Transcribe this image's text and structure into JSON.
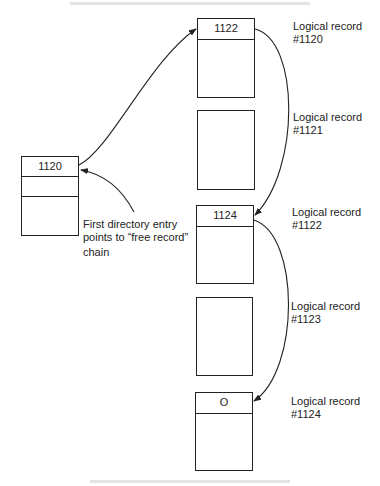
{
  "directory": {
    "entries": [
      "1120",
      "",
      ""
    ],
    "annotation": [
      "First directory entry",
      "points to “free record”",
      "chain"
    ]
  },
  "records": [
    {
      "pointer": "1122",
      "label_line1": "Logical record",
      "label_line2": "#1120",
      "has_pointer": true
    },
    {
      "pointer": "",
      "label_line1": "Logical record",
      "label_line2": "#1121",
      "has_pointer": false
    },
    {
      "pointer": "1124",
      "label_line1": "Logical record",
      "label_line2": "#1122",
      "has_pointer": true
    },
    {
      "pointer": "",
      "label_line1": "Logical record",
      "label_line2": "#1123",
      "has_pointer": false
    },
    {
      "pointer": "O",
      "label_line1": "Logical record",
      "label_line2": "#1124",
      "has_pointer": true
    }
  ],
  "colors": {
    "line": "#222222",
    "background": "#ffffff"
  }
}
